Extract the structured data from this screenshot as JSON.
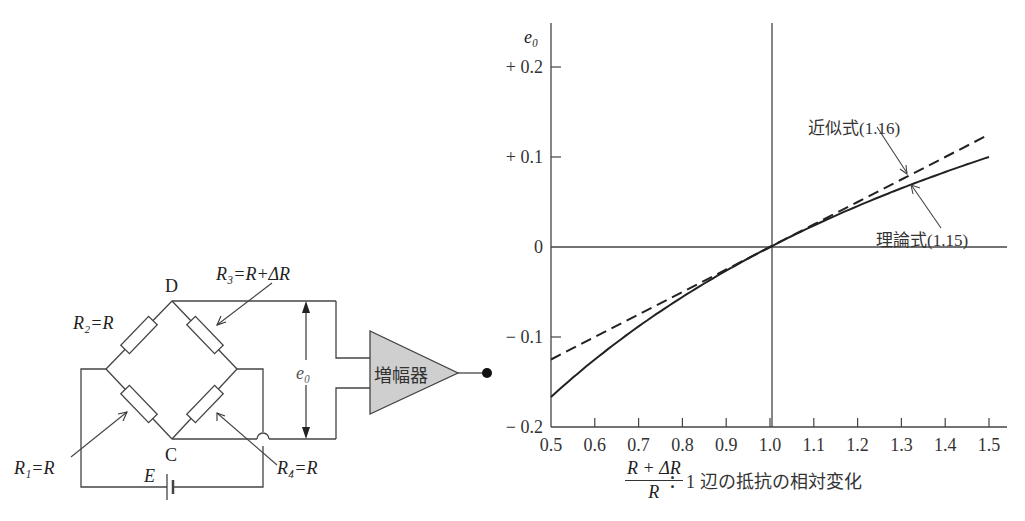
{
  "circuit": {
    "node_top": "D",
    "node_bottom": "C",
    "r1_label": "R₁=R",
    "r2_label": "R₂=R",
    "r3_label": "R₃=R+ΔR",
    "r4_label": "R₄=R",
    "battery_label": "E",
    "output_label": "e₀",
    "amplifier_label": "増幅器"
  },
  "chart_data": {
    "type": "line",
    "title": "",
    "xlabel_fraction_numerator": "R + ΔR",
    "xlabel_fraction_denominator": "R",
    "xlabel_text": "：1 辺の抵抗の相対変化",
    "ylabel": "e₀",
    "xlim": [
      0.5,
      1.5
    ],
    "ylim": [
      -0.2,
      0.2
    ],
    "x_ticks": [
      "0.5",
      "0.6",
      "0.7",
      "0.8",
      "0.9",
      "1.0",
      "1.1",
      "1.2",
      "1.3",
      "1.4",
      "1.5"
    ],
    "y_ticks": [
      "+ 0.2",
      "+ 0.1",
      "0",
      "− 0.1",
      "− 0.2"
    ],
    "grid": false,
    "reference_lines": {
      "x": 1.0,
      "y": 0
    },
    "x": [
      0.5,
      0.6,
      0.7,
      0.8,
      0.9,
      1.0,
      1.1,
      1.2,
      1.3,
      1.4,
      1.5
    ],
    "series": [
      {
        "name": "理論式(1.15)",
        "style": "solid",
        "values": [
          -0.167,
          -0.125,
          -0.088,
          -0.056,
          -0.026,
          0.0,
          0.024,
          0.045,
          0.065,
          0.083,
          0.1
        ]
      },
      {
        "name": "近似式(1.16)",
        "style": "dashed",
        "values": [
          -0.125,
          -0.1,
          -0.075,
          -0.05,
          -0.025,
          0.0,
          0.025,
          0.05,
          0.075,
          0.1,
          0.125
        ]
      }
    ],
    "annotations": [
      {
        "text": "近似式(1.16)",
        "points_to": "dashed line near x=1.3"
      },
      {
        "text": "理論式(1.15)",
        "points_to": "solid line near x=1.3"
      }
    ]
  }
}
